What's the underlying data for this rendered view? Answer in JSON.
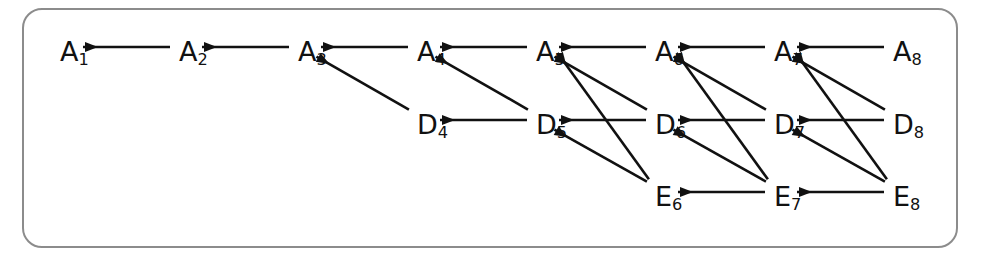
{
  "figure": {
    "frame": {
      "stroke": "#8c8c8c",
      "radius_px": 20,
      "background": "#ffffff"
    },
    "edge_color": "#111111",
    "label_color": "#111111"
  },
  "layout": {
    "col_x": [
      60,
      179,
      298,
      417,
      536,
      655,
      774,
      893
    ],
    "row_y": {
      "A": 52,
      "D": 125,
      "E": 197
    },
    "columns": [
      1,
      2,
      3,
      4,
      5,
      6,
      7,
      8
    ]
  },
  "nodes": [
    {
      "id": "A1",
      "base": "A",
      "sub": "1",
      "row": "A",
      "col": 1
    },
    {
      "id": "A2",
      "base": "A",
      "sub": "2",
      "row": "A",
      "col": 2
    },
    {
      "id": "A3",
      "base": "A",
      "sub": "3",
      "row": "A",
      "col": 3
    },
    {
      "id": "A4",
      "base": "A",
      "sub": "4",
      "row": "A",
      "col": 4
    },
    {
      "id": "A5",
      "base": "A",
      "sub": "5",
      "row": "A",
      "col": 5
    },
    {
      "id": "A6",
      "base": "A",
      "sub": "6",
      "row": "A",
      "col": 6
    },
    {
      "id": "A7",
      "base": "A",
      "sub": "7",
      "row": "A",
      "col": 7
    },
    {
      "id": "A8",
      "base": "A",
      "sub": "8",
      "row": "A",
      "col": 8
    },
    {
      "id": "D4",
      "base": "D",
      "sub": "4",
      "row": "D",
      "col": 4
    },
    {
      "id": "D5",
      "base": "D",
      "sub": "5",
      "row": "D",
      "col": 5
    },
    {
      "id": "D6",
      "base": "D",
      "sub": "6",
      "row": "D",
      "col": 6
    },
    {
      "id": "D7",
      "base": "D",
      "sub": "7",
      "row": "D",
      "col": 7
    },
    {
      "id": "D8",
      "base": "D",
      "sub": "8",
      "row": "D",
      "col": 8
    },
    {
      "id": "E6",
      "base": "E",
      "sub": "6",
      "row": "E",
      "col": 6
    },
    {
      "id": "E7",
      "base": "E",
      "sub": "7",
      "row": "E",
      "col": 7
    },
    {
      "id": "E8",
      "base": "E",
      "sub": "8",
      "row": "E",
      "col": 8
    }
  ],
  "edges": [
    {
      "from": "A2",
      "to": "A1",
      "kind": "horizontal"
    },
    {
      "from": "A3",
      "to": "A2",
      "kind": "horizontal"
    },
    {
      "from": "A4",
      "to": "A3",
      "kind": "horizontal"
    },
    {
      "from": "A5",
      "to": "A4",
      "kind": "horizontal"
    },
    {
      "from": "A6",
      "to": "A5",
      "kind": "horizontal"
    },
    {
      "from": "A7",
      "to": "A6",
      "kind": "horizontal"
    },
    {
      "from": "A8",
      "to": "A7",
      "kind": "horizontal"
    },
    {
      "from": "D5",
      "to": "D4",
      "kind": "horizontal"
    },
    {
      "from": "D6",
      "to": "D5",
      "kind": "horizontal"
    },
    {
      "from": "D7",
      "to": "D6",
      "kind": "horizontal"
    },
    {
      "from": "D8",
      "to": "D7",
      "kind": "horizontal"
    },
    {
      "from": "E7",
      "to": "E6",
      "kind": "horizontal"
    },
    {
      "from": "E8",
      "to": "E7",
      "kind": "horizontal"
    },
    {
      "from": "D4",
      "to": "A3",
      "kind": "diagonal"
    },
    {
      "from": "D5",
      "to": "A4",
      "kind": "diagonal"
    },
    {
      "from": "D6",
      "to": "A5",
      "kind": "diagonal"
    },
    {
      "from": "D7",
      "to": "A6",
      "kind": "diagonal"
    },
    {
      "from": "D8",
      "to": "A7",
      "kind": "diagonal"
    },
    {
      "from": "E6",
      "to": "A5",
      "kind": "diagonal-long"
    },
    {
      "from": "E7",
      "to": "A6",
      "kind": "diagonal-long"
    },
    {
      "from": "E8",
      "to": "A7",
      "kind": "diagonal-long"
    },
    {
      "from": "E6",
      "to": "D5",
      "kind": "diagonal"
    },
    {
      "from": "E7",
      "to": "D6",
      "kind": "diagonal"
    },
    {
      "from": "E8",
      "to": "D7",
      "kind": "diagonal"
    }
  ]
}
